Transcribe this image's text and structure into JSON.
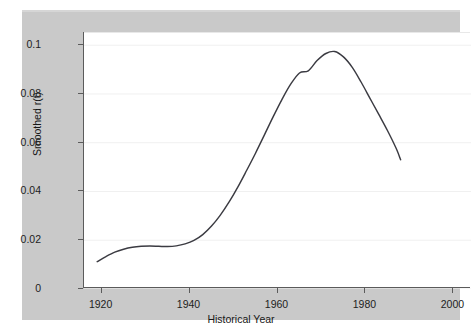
{
  "chart_data": {
    "type": "line",
    "title": "",
    "xlabel": "Historical Year",
    "ylabel": "Smoothed r(t)",
    "xlim": [
      1916,
      2004
    ],
    "ylim": [
      0,
      0.105
    ],
    "xticks": [
      1920,
      1940,
      1960,
      1980,
      2000
    ],
    "xtick_labels": [
      "1920",
      "1940",
      "1960",
      "1980",
      "2000"
    ],
    "yticks": [
      0,
      0.02,
      0.04,
      0.06,
      0.08,
      0.1
    ],
    "ytick_labels": [
      "0",
      "0.02",
      "0.04",
      "0.06",
      "0.08",
      "0.1"
    ],
    "grid": "horizontal-only",
    "legend": "none",
    "series": [
      {
        "name": "Smoothed r(t)",
        "color": "#3b3b42",
        "x": [
          1919,
          1921,
          1923,
          1925,
          1927,
          1929,
          1931,
          1933,
          1935,
          1937,
          1939,
          1941,
          1943,
          1945,
          1947,
          1949,
          1951,
          1953,
          1955,
          1957,
          1959,
          1961,
          1963,
          1965,
          1967,
          1969,
          1971,
          1973,
          1975,
          1977,
          1979,
          1981,
          1983,
          1985,
          1987,
          1988
        ],
        "y": [
          0.0112,
          0.0133,
          0.0151,
          0.0163,
          0.0171,
          0.0175,
          0.0176,
          0.0175,
          0.0174,
          0.0177,
          0.0185,
          0.0199,
          0.0223,
          0.0258,
          0.0303,
          0.0357,
          0.0419,
          0.0487,
          0.0557,
          0.0631,
          0.0706,
          0.0777,
          0.084,
          0.0886,
          0.0895,
          0.0937,
          0.0966,
          0.0974,
          0.0952,
          0.0909,
          0.0849,
          0.0783,
          0.0717,
          0.065,
          0.0576,
          0.053
        ]
      }
    ],
    "annotations": {
      "peak_value": 0.0985,
      "peak_year": 1971,
      "start_value": 0.0112,
      "start_year": 1919,
      "end_value": 0.053,
      "end_year": 1988,
      "plateau_value": 0.0175,
      "plateau_years": "1928-1936"
    },
    "colors": {
      "figure_background": "#c9c9c9",
      "plot_background": "#ffffff",
      "curve": "#3b3b42",
      "axis": "#5b5b5b",
      "gridline": "#f0f0f0",
      "text": "#1d1d1d"
    }
  }
}
